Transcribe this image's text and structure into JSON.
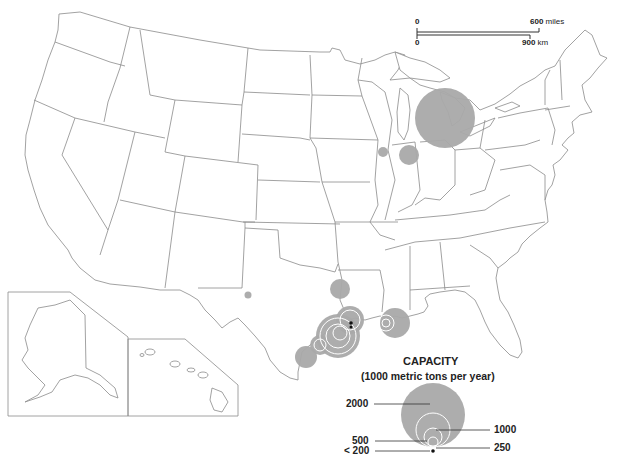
{
  "map": {
    "subject": "Production capacity by location, contiguous US with Alaska and Hawaii insets",
    "colors": {
      "bubble": "#a9a9a9",
      "ring": "#ffffff",
      "border": "#8a8a8a",
      "text": "#222222"
    }
  },
  "scale_bar": {
    "miles_start": "0",
    "miles_end": "600",
    "miles_unit": "miles",
    "km_start": "0",
    "km_end": "900",
    "km_unit": "km"
  },
  "legend": {
    "title": "CAPACITY",
    "subtitle": "(1000 metric tons per year)",
    "sizes": [
      {
        "label": "2000",
        "value": 2000
      },
      {
        "label": "1000",
        "value": 1000
      },
      {
        "label": "500",
        "value": 500
      },
      {
        "label": "250",
        "value": 250
      },
      {
        "label": "< 200",
        "value": 200
      }
    ]
  },
  "sites": [
    {
      "region": "Michigan / Great Lakes",
      "approx_capacity": 2000
    },
    {
      "region": "Northern Illinois (Chicago area)",
      "approx_capacity": 500
    },
    {
      "region": "Iowa/Illinois border",
      "approx_capacity": 200
    },
    {
      "region": "West Texas",
      "approx_capacity": 200
    },
    {
      "region": "East Texas / Louisiana border",
      "approx_capacity": 1000
    },
    {
      "region": "Texas Gulf Coast (Houston cluster)",
      "approx_capacity": 2000
    },
    {
      "region": "Southeast Texas / Louisiana (Beaumont)",
      "approx_capacity": 1000
    },
    {
      "region": "South Texas Coast (Corpus Christi)",
      "approx_capacity": 1000
    },
    {
      "region": "Louisiana (Baton Rouge / New Orleans)",
      "approx_capacity": 1000
    }
  ]
}
